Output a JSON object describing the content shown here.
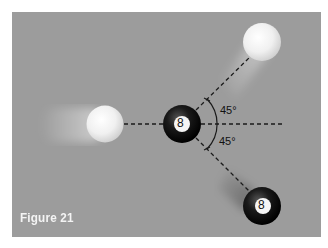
{
  "figure": {
    "caption": "Figure 21",
    "background_color": "#9c9c9c",
    "angles": [
      {
        "label": "45°",
        "position": "upper"
      },
      {
        "label": "45°",
        "position": "lower"
      }
    ],
    "balls": [
      {
        "name": "cue-ball-incoming",
        "type": "cue",
        "label": ""
      },
      {
        "name": "eight-ball-center",
        "type": "eight",
        "label": "8"
      },
      {
        "name": "cue-ball-deflected",
        "type": "cue",
        "label": ""
      },
      {
        "name": "eight-ball-deflected",
        "type": "eight",
        "label": "8"
      }
    ]
  }
}
